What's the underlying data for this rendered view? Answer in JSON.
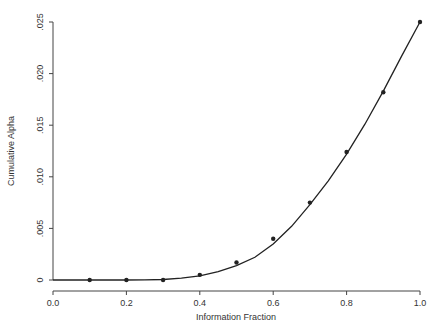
{
  "chart_data": {
    "type": "line",
    "title": "",
    "xlabel": "Information Fraction",
    "ylabel": "Cumulative Alpha",
    "xlim": [
      0.0,
      1.0
    ],
    "ylim": [
      0,
      0.025
    ],
    "grid": false,
    "legend": null,
    "x_ticks": [
      "0.0",
      "0.2",
      "0.4",
      "0.6",
      "0.8",
      "1.0"
    ],
    "y_ticks": [
      "0",
      ".005",
      ".010",
      ".015",
      ".020",
      ".025"
    ],
    "series": [
      {
        "name": "points",
        "style": "scatter",
        "x": [
          0.1,
          0.2,
          0.3,
          0.4,
          0.5,
          0.6,
          0.7,
          0.8,
          0.9,
          1.0
        ],
        "y": [
          0.0,
          0.0,
          0.0,
          0.0005,
          0.0017,
          0.004,
          0.0075,
          0.0124,
          0.0182,
          0.025
        ]
      },
      {
        "name": "spending function curve",
        "style": "line",
        "x": [
          0.0,
          0.1,
          0.2,
          0.25,
          0.3,
          0.35,
          0.4,
          0.45,
          0.5,
          0.55,
          0.6,
          0.65,
          0.7,
          0.75,
          0.8,
          0.85,
          0.9,
          0.95,
          1.0
        ],
        "y": [
          0.0,
          0.0,
          0.0,
          1e-05,
          5e-05,
          0.00017,
          0.0004,
          0.0008,
          0.0014,
          0.0022,
          0.0035,
          0.0052,
          0.0073,
          0.0096,
          0.0122,
          0.0151,
          0.0183,
          0.0217,
          0.025
        ]
      }
    ]
  }
}
